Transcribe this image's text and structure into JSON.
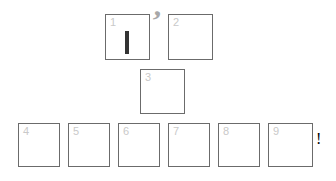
{
  "canvas": {
    "width": 336,
    "height": 181,
    "background": "#ffffff",
    "box_border_color": "#6b6b6b",
    "box_fill_color": "#ffffff",
    "label_color": "#c9c9c9",
    "caret_color": "#333333",
    "comma_color": "#a8a8a8",
    "bang_color": "#2e2e2e"
  },
  "boxes": [
    {
      "label": "1",
      "x": 105,
      "y": 14,
      "w": 45,
      "h": 46,
      "content": "text-caret"
    },
    {
      "label": "2",
      "x": 168,
      "y": 14,
      "w": 45,
      "h": 46,
      "content": ""
    },
    {
      "label": "3",
      "x": 140,
      "y": 69,
      "w": 45,
      "h": 45,
      "content": ""
    },
    {
      "label": "4",
      "x": 18,
      "y": 123,
      "w": 42,
      "h": 44,
      "content": ""
    },
    {
      "label": "5",
      "x": 68,
      "y": 123,
      "w": 42,
      "h": 44,
      "content": ""
    },
    {
      "label": "6",
      "x": 118,
      "y": 123,
      "w": 42,
      "h": 44,
      "content": ""
    },
    {
      "label": "7",
      "x": 168,
      "y": 123,
      "w": 42,
      "h": 44,
      "content": ""
    },
    {
      "label": "8",
      "x": 218,
      "y": 123,
      "w": 42,
      "h": 44,
      "content": ""
    },
    {
      "label": "9",
      "x": 268,
      "y": 123,
      "w": 45,
      "h": 44,
      "content": ""
    }
  ],
  "marks": [
    {
      "name": "comma-mark",
      "glyph": "’",
      "x": 151,
      "y": 6
    },
    {
      "name": "exclamation-mark",
      "glyph": "!",
      "x": 316,
      "y": 131
    }
  ],
  "caret": {
    "x": 124,
    "y": 30,
    "w": 4,
    "h": 23
  }
}
